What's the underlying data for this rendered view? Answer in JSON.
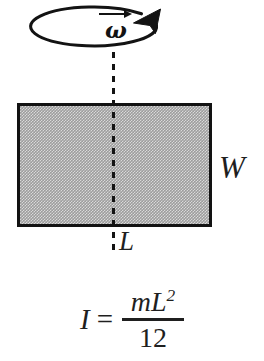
{
  "figure": {
    "background_color": "#ffffff",
    "ink_color": "#131313",
    "plate_fill_color": "#9d9d9d"
  },
  "rotation": {
    "indicator_name": "rotation-direction-ellipse",
    "arrow_direction": "counterclockwise-viewed-from-above",
    "omega_symbol": "ω",
    "omega_is_vector": true
  },
  "plate": {
    "label_width": "W",
    "label_length": "L",
    "axis_style": "dashed",
    "axis_position": "vertical-center"
  },
  "formula": {
    "lhs": "I",
    "equals": "=",
    "numerator_prefix": "mL",
    "numerator_exponent": "2",
    "denominator": "12",
    "plain_text": "I = mL² / 12"
  }
}
